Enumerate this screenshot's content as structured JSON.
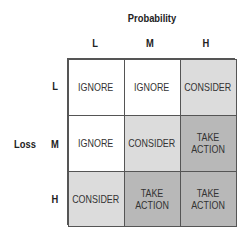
{
  "title": {
    "x_axis": "Probability",
    "y_axis": "Loss"
  },
  "columns": [
    "L",
    "M",
    "H"
  ],
  "rows": [
    "L",
    "M",
    "H"
  ],
  "colors": {
    "IGNORE": "#ffffff",
    "CONSIDER": "#dcdcdc",
    "TAKE ACTION": "#b8b8b8"
  },
  "matrix": [
    [
      "IGNORE",
      "IGNORE",
      "CONSIDER"
    ],
    [
      "IGNORE",
      "CONSIDER",
      "TAKE ACTION"
    ],
    [
      "CONSIDER",
      "TAKE ACTION",
      "TAKE ACTION"
    ]
  ]
}
